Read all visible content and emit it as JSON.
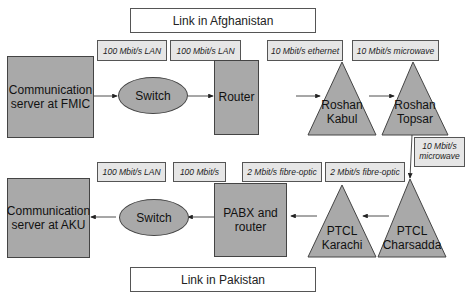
{
  "regions": {
    "afghanistan": "Link in Afghanistan",
    "pakistan": "Link in Pakistan"
  },
  "top_row": {
    "nodes": {
      "server": "Communication server at FMIC",
      "server_line1": "Communication",
      "server_line2": "server at FMIC",
      "switch": "Switch",
      "router": "Router",
      "roshan_kabul_line1": "Roshan",
      "roshan_kabul_line2": "Kabul",
      "roshan_topsar_line1": "Roshan",
      "roshan_topsar_line2": "Topsar"
    },
    "links": [
      "100 Mbit/s LAN",
      "100 Mbit/s LAN",
      "10 Mbit/s ethernet",
      "10 Mbit/s microwave"
    ]
  },
  "cross_link": {
    "line1": "10 Mbit/s",
    "line2": "microwave"
  },
  "bottom_row": {
    "nodes": {
      "server_line1": "Communication",
      "server_line2": "server at AKU",
      "switch": "Switch",
      "pabx_line1": "PABX and",
      "pabx_line2": "router",
      "ptcl_karachi_line1": "PTCL",
      "ptcl_karachi_line2": "Karachi",
      "ptcl_charsadda_line1": "PTCL",
      "ptcl_charsadda_line2": "Charsadda"
    },
    "links": [
      "100 Mbit/s LAN",
      "100 Mbit/s",
      "2 Mbit/s fibre-optic",
      "2 Mbit/s fibre-optic"
    ]
  },
  "colors": {
    "node_fill": "#a9a9a9",
    "label_fill": "#e6e6e6",
    "stroke": "#444444"
  }
}
